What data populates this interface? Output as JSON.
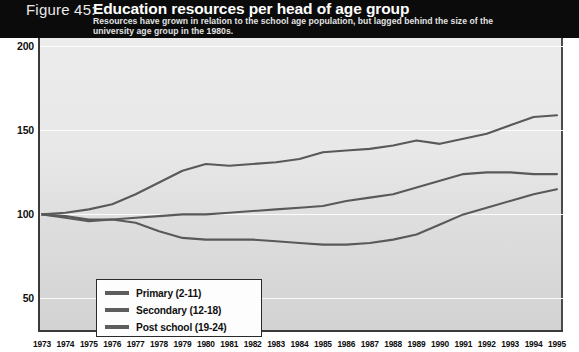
{
  "figure": {
    "number_label": "Figure 45:",
    "title": "Education resources per head of age group",
    "subtitle_line1": "Resources have grown in relation to the school age population, but lagged behind the size of the",
    "subtitle_line2": "university age group in the 1980s."
  },
  "legend": {
    "items": [
      {
        "label": "Primary (2-11)",
        "color": "#5d5d5d"
      },
      {
        "label": "Secondary (12-18)",
        "color": "#5d5d5d"
      },
      {
        "label": "Post school (19-24)",
        "color": "#5d5d5d"
      }
    ]
  },
  "axes": {
    "y_ticks": [
      "200",
      "150",
      "100",
      "50"
    ],
    "y_min": 30,
    "y_max": 205
  },
  "chart_data": {
    "type": "line",
    "title": "Education resources per head of age group",
    "subtitle": "Resources have grown in relation to the school age population, but lagged behind the size of the university age group in the 1980s.",
    "xlabel": "",
    "ylabel": "",
    "ylim": [
      30,
      205
    ],
    "yticks": [
      50,
      100,
      150,
      200
    ],
    "grid": true,
    "legend_position": "lower-left",
    "x": [
      "1973",
      "1974",
      "1975",
      "1976",
      "1977",
      "1978",
      "1979",
      "1980",
      "1981",
      "1982",
      "1983",
      "1984",
      "1985",
      "1986",
      "1987",
      "1988",
      "1989",
      "1990",
      "1991",
      "1992",
      "1993",
      "1994",
      "1995"
    ],
    "series": [
      {
        "name": "Primary (2-11)",
        "values": [
          100,
          101,
          103,
          106,
          112,
          119,
          126,
          130,
          129,
          130,
          131,
          133,
          137,
          138,
          139,
          141,
          144,
          142,
          145,
          148,
          153,
          158,
          159
        ]
      },
      {
        "name": "Secondary (12-18)",
        "values": [
          100,
          99,
          97,
          97,
          98,
          99,
          100,
          100,
          101,
          102,
          103,
          104,
          105,
          108,
          110,
          112,
          116,
          120,
          124,
          125,
          125,
          124,
          124
        ]
      },
      {
        "name": "Post school (19-24)",
        "values": [
          100,
          98,
          96,
          97,
          95,
          90,
          86,
          85,
          85,
          85,
          84,
          83,
          82,
          82,
          83,
          85,
          88,
          94,
          100,
          104,
          108,
          112,
          115
        ]
      }
    ]
  }
}
